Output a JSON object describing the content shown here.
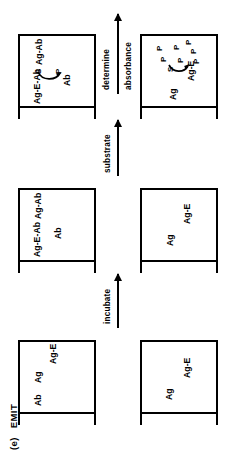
{
  "figure": {
    "panel_letter": "(e)",
    "title": "EMIT",
    "orientation_note": "rotated"
  },
  "steps": [
    {
      "name": "step-1",
      "top_tube": {
        "species": [
          "Ab",
          "Ag",
          "Ag-E"
        ]
      },
      "bottom_tube": {
        "species": [
          "Ag",
          "Ag-E"
        ]
      }
    },
    {
      "name": "step-2",
      "top_tube": {
        "species": [
          "Ag-E-Ab",
          "Ab",
          "Ag-Ab"
        ]
      },
      "bottom_tube": {
        "species": [
          "Ag",
          "Ag-E"
        ]
      }
    },
    {
      "name": "step-3",
      "top_tube": {
        "species": [
          "Ag-E-Ab",
          "Ab",
          "Ag-Ab"
        ],
        "reaction": {
          "substrate": "S",
          "product": "P"
        }
      },
      "bottom_tube": {
        "species": [
          "Ag",
          "Ag-E"
        ],
        "reaction": {
          "substrate": "S",
          "product": "P"
        },
        "products": [
          "P",
          "P",
          "P",
          "P",
          "P",
          "P",
          "P"
        ]
      }
    }
  ],
  "arrows": [
    {
      "name": "arrow-incubate",
      "label": "incubate",
      "label2": ""
    },
    {
      "name": "arrow-substrate",
      "label": "substrate",
      "label2": ""
    },
    {
      "name": "arrow-determine",
      "label": "determine",
      "label2": "absorbance"
    }
  ]
}
